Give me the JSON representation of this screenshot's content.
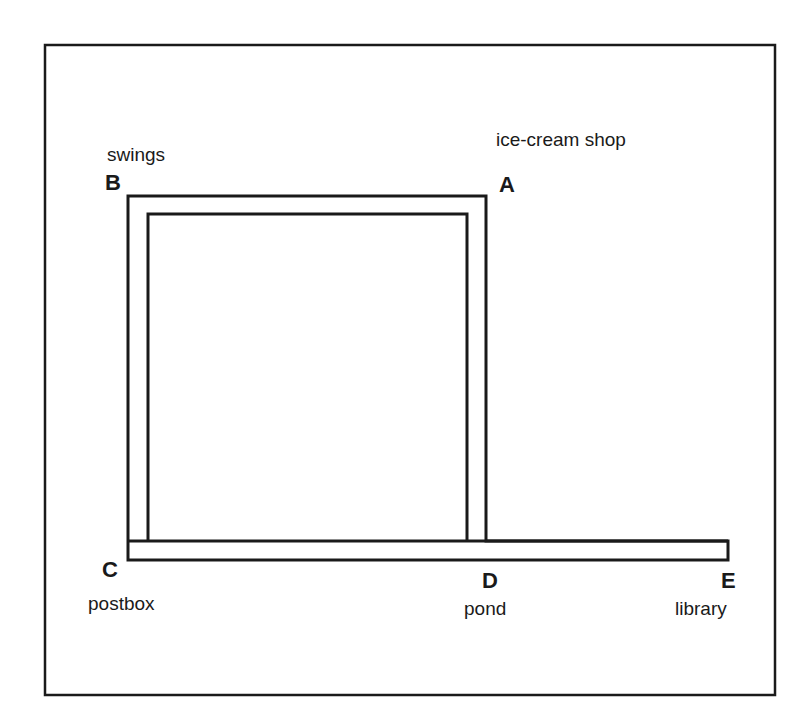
{
  "diagram": {
    "type": "route-map",
    "colors": {
      "line": "#1a1a1a",
      "background": "#ffffff"
    },
    "points": [
      {
        "id": "A",
        "label": "A",
        "place": "ice-cream shop"
      },
      {
        "id": "B",
        "label": "B",
        "place": "swings"
      },
      {
        "id": "C",
        "label": "C",
        "place": "postbox"
      },
      {
        "id": "D",
        "label": "D",
        "place": "pond"
      },
      {
        "id": "E",
        "label": "E",
        "place": "library"
      }
    ],
    "paths": [
      {
        "from": "A",
        "to": "B"
      },
      {
        "from": "B",
        "to": "C"
      },
      {
        "from": "A",
        "to": "D"
      },
      {
        "from": "C",
        "to": "D"
      },
      {
        "from": "D",
        "to": "E"
      }
    ]
  }
}
